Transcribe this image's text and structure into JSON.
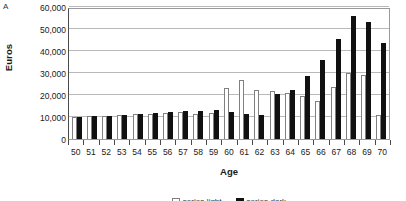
{
  "panel": {
    "letter": "A"
  },
  "axes": {
    "ylabel": "Euros",
    "xlabel": "Age",
    "yticks": [
      "60,000",
      "50,000",
      "40,000",
      "30,000",
      "20,000",
      "10,000",
      "0"
    ]
  },
  "colors": {
    "series_light": "#ffffff",
    "series_light_edge": "#808080",
    "series_dark": "#111111",
    "gridline": "#b9b9b9",
    "frame": "#9a9a9a",
    "axis": "#4a4a4a"
  },
  "chart_data": {
    "type": "bar",
    "title": "A",
    "xlabel": "Age",
    "ylabel": "Euros",
    "ylim": [
      0,
      60000
    ],
    "ytick_step": 10000,
    "grid": true,
    "legend_position": "below-cropped",
    "legend_note": "Legend row is cut off at the bottom edge of the screenshot; labels are not legible.",
    "categories": [
      50,
      51,
      52,
      53,
      54,
      55,
      56,
      57,
      58,
      59,
      60,
      61,
      62,
      63,
      64,
      65,
      66,
      67,
      68,
      69,
      70
    ],
    "series": [
      {
        "name": "series-light",
        "values": [
          10000,
          10500,
          10500,
          10800,
          11500,
          11500,
          12000,
          12500,
          11500,
          12000,
          23000,
          27000,
          22500,
          22000,
          21000,
          19500,
          17500,
          23500,
          30000,
          29000,
          11000
        ]
      },
      {
        "name": "series-dark",
        "values": [
          10200,
          10600,
          10600,
          11000,
          11500,
          11800,
          12200,
          12600,
          12800,
          13000,
          12500,
          11500,
          11000,
          20500,
          22500,
          28500,
          36000,
          45500,
          56000,
          53000,
          43500
        ]
      }
    ]
  }
}
